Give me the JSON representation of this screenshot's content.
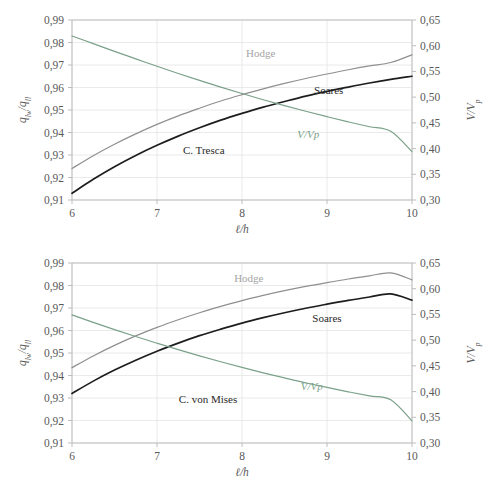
{
  "figure": {
    "background": "#ffffff",
    "colors": {
      "black": "#1d1d1d",
      "grey": "#8f8f8f",
      "green": "#7ba189",
      "grid": "#e4e4e4",
      "axis": "#bdbdbd",
      "text": "#595959"
    }
  },
  "chart_data": [
    {
      "type": "line",
      "panel": "top",
      "title": "",
      "xlabel": "ℓ/h",
      "ylabel": "q_lw/q_ll",
      "ylabel_parts": {
        "base1": "q",
        "sub1": "lw",
        "slash": "/",
        "base2": "q",
        "sub2": "ll"
      },
      "y2label": "V/V_p",
      "y2label_parts": {
        "base": "V/V",
        "sub": "p"
      },
      "xlim": [
        6,
        10
      ],
      "ylim": [
        0.91,
        0.99
      ],
      "y2lim": [
        0.3,
        0.65
      ],
      "grid": true,
      "legend": "inline-annotations",
      "xticks": [
        6,
        7,
        8,
        9,
        10
      ],
      "xticklabels": [
        "6",
        "7",
        "8",
        "9",
        "10"
      ],
      "yticks": [
        0.91,
        0.92,
        0.93,
        0.94,
        0.95,
        0.96,
        0.97,
        0.98,
        0.99
      ],
      "yticklabels": [
        "0,91",
        "0,92",
        "0,93",
        "0,94",
        "0,95",
        "0,96",
        "0,97",
        "0,98",
        "0,99"
      ],
      "y2ticks": [
        0.3,
        0.35,
        0.4,
        0.45,
        0.5,
        0.55,
        0.6,
        0.65
      ],
      "y2ticklabels": [
        "0,30",
        "0,35",
        "0,40",
        "0,45",
        "0,50",
        "0,55",
        "0,60",
        "0,65"
      ],
      "x": [
        6.0,
        6.25,
        6.5,
        6.75,
        7.0,
        7.25,
        7.5,
        7.75,
        8.0,
        8.25,
        8.5,
        8.75,
        9.0,
        9.25,
        9.5,
        9.75,
        10.0
      ],
      "series": [
        {
          "name": "Hodge",
          "axis": "left",
          "color": "#8f8f8f",
          "label": "Hodge",
          "label_at": {
            "x": 8.22,
            "y": 0.9735
          },
          "values": [
            0.924,
            0.9297,
            0.9348,
            0.9394,
            0.9436,
            0.9474,
            0.9508,
            0.954,
            0.9568,
            0.9594,
            0.9618,
            0.964,
            0.966,
            0.9679,
            0.9696,
            0.9711,
            0.9745
          ]
        },
        {
          "name": "C. Tresca",
          "axis": "left",
          "color": "#1d1d1d",
          "label": "C. Tresca",
          "label_at": {
            "x": 7.55,
            "y": 0.9305
          },
          "values": [
            0.913,
            0.9192,
            0.9248,
            0.9298,
            0.9343,
            0.9384,
            0.9421,
            0.9455,
            0.9485,
            0.9513,
            0.9538,
            0.9562,
            0.9583,
            0.9602,
            0.962,
            0.9636,
            0.965
          ]
        },
        {
          "name": "Soares",
          "axis": "left",
          "color": "#1d1d1d",
          "label": "Soares",
          "label_at": {
            "x": 9.02,
            "y": 0.957
          },
          "is_label_only": true,
          "values": []
        },
        {
          "name": "V/Vp",
          "axis": "right",
          "color": "#7ba189",
          "label": "V/Vp",
          "label_at": {
            "x": 8.78,
            "y": 0.4215
          },
          "values": [
            0.619,
            0.604,
            0.589,
            0.5745,
            0.56,
            0.546,
            0.5325,
            0.5195,
            0.507,
            0.495,
            0.4835,
            0.4725,
            0.462,
            0.452,
            0.4425,
            0.4335,
            0.394
          ]
        }
      ]
    },
    {
      "type": "line",
      "panel": "bottom",
      "title": "",
      "xlabel": "ℓ/h",
      "ylabel": "q_lw/q_ll",
      "ylabel_parts": {
        "base1": "q",
        "sub1": "lw",
        "slash": "/",
        "base2": "q",
        "sub2": "ll"
      },
      "y2label": "V/V_p",
      "y2label_parts": {
        "base": "V/V",
        "sub": "p"
      },
      "xlim": [
        6,
        10
      ],
      "ylim": [
        0.91,
        0.99
      ],
      "y2lim": [
        0.3,
        0.65
      ],
      "grid": true,
      "legend": "inline-annotations",
      "xticks": [
        6,
        7,
        8,
        9,
        10
      ],
      "xticklabels": [
        "6",
        "7",
        "8",
        "9",
        "10"
      ],
      "yticks": [
        0.91,
        0.92,
        0.93,
        0.94,
        0.95,
        0.96,
        0.97,
        0.98,
        0.99
      ],
      "yticklabels": [
        "0,91",
        "0,92",
        "0,93",
        "0,94",
        "0,95",
        "0,96",
        "0,97",
        "0,98",
        "0,99"
      ],
      "y2ticks": [
        0.3,
        0.35,
        0.4,
        0.45,
        0.5,
        0.55,
        0.6,
        0.65
      ],
      "y2ticklabels": [
        "0,30",
        "0,35",
        "0,40",
        "0,45",
        "0,50",
        "0,55",
        "0,60",
        "0,65"
      ],
      "x": [
        6.0,
        6.25,
        6.5,
        6.75,
        7.0,
        7.25,
        7.5,
        7.75,
        8.0,
        8.25,
        8.5,
        8.75,
        9.0,
        9.25,
        9.5,
        9.75,
        10.0
      ],
      "series": [
        {
          "name": "Hodge",
          "axis": "left",
          "color": "#8f8f8f",
          "label": "Hodge",
          "label_at": {
            "x": 8.08,
            "y": 0.9815
          },
          "values": [
            0.9435,
            0.9487,
            0.9534,
            0.9576,
            0.9614,
            0.9648,
            0.9679,
            0.9707,
            0.9733,
            0.9756,
            0.9777,
            0.9796,
            0.9813,
            0.9829,
            0.9843,
            0.9856,
            0.9825
          ]
        },
        {
          "name": "C. von Mises",
          "axis": "left",
          "color": "#1d1d1d",
          "label": "C. von Mises",
          "label_at": {
            "x": 7.6,
            "y": 0.9278
          },
          "values": [
            0.932,
            0.9375,
            0.9424,
            0.9468,
            0.9508,
            0.9544,
            0.9577,
            0.9606,
            0.9633,
            0.9657,
            0.9679,
            0.9699,
            0.9717,
            0.9734,
            0.9749,
            0.9763,
            0.9735
          ]
        },
        {
          "name": "Soares",
          "axis": "left",
          "color": "#1d1d1d",
          "label": "Soares",
          "label_at": {
            "x": 9.0,
            "y": 0.964
          },
          "is_label_only": true,
          "values": []
        },
        {
          "name": "V/Vp",
          "axis": "right",
          "color": "#7ba189",
          "label": "V/Vp",
          "label_at": {
            "x": 8.82,
            "y": 0.403
          },
          "values": [
            0.549,
            0.5345,
            0.5205,
            0.507,
            0.494,
            0.4815,
            0.4695,
            0.458,
            0.447,
            0.4365,
            0.4265,
            0.417,
            0.408,
            0.3995,
            0.3915,
            0.384,
            0.343
          ]
        }
      ]
    }
  ]
}
